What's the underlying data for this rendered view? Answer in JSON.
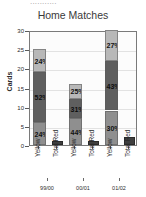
{
  "page": {
    "cutoff_text": "..........."
  },
  "chart_data": {
    "type": "bar",
    "title": "Home Matches",
    "xlabel": "",
    "ylabel": "Cards",
    "ylim": [
      0,
      30
    ],
    "yticks": [
      0,
      5,
      10,
      15,
      20,
      25,
      30
    ],
    "grid": true,
    "legend": "none",
    "stacked": true,
    "groups": [
      {
        "season": "99/00",
        "bars": [
          {
            "name": "Yellow",
            "total": 25,
            "segments": [
              {
                "label": "24%",
                "value": 6
              },
              {
                "label": "52%",
                "value": 13
              },
              {
                "label": "24%",
                "value": 6
              }
            ]
          },
          {
            "name": "Total Red",
            "total": 1,
            "segments": []
          }
        ]
      },
      {
        "season": "00/01",
        "bars": [
          {
            "name": "Yellow",
            "total": 16,
            "segments": [
              {
                "label": "25%",
                "value": 4
              },
              {
                "label": "31%",
                "value": 5
              },
              {
                "label": "44%",
                "value": 7
              }
            ]
          },
          {
            "name": "Total Red",
            "total": 1,
            "segments": []
          }
        ]
      },
      {
        "season": "01/02",
        "bars": [
          {
            "name": "Yellow",
            "total": 30,
            "segments": [
              {
                "label": "27%",
                "value": 8
              },
              {
                "label": "43%",
                "value": 13
              },
              {
                "label": "30%",
                "value": 9
              }
            ]
          },
          {
            "name": "Total Red",
            "total": 2,
            "segments": []
          }
        ]
      }
    ],
    "colors": {
      "segment_top": "#b8b8b8",
      "segment_middle": "#5f5f5f",
      "segment_bottom": "#8f8f8f",
      "total_red": "#3f3f3f",
      "plot_background": "#fcfcfc",
      "grid": "#e2e2e2",
      "axis": "#7a7a7a",
      "text": "#2c2c2c"
    }
  }
}
